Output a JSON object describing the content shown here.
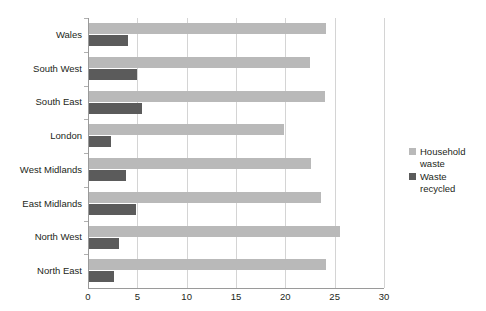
{
  "chart_data": {
    "type": "bar",
    "orientation": "horizontal",
    "title": "",
    "subtitle": "",
    "xlabel": "",
    "ylabel": "",
    "categories": [
      "Wales",
      "South West",
      "South East",
      "London",
      "West Midlands",
      "East Midlands",
      "North West",
      "North East"
    ],
    "series": [
      {
        "name": "Household waste",
        "color": "#b9b9b9",
        "values": [
          24.0,
          22.4,
          23.9,
          19.8,
          22.5,
          23.5,
          25.4,
          24.0
        ]
      },
      {
        "name": "Waste recycled",
        "color": "#5b5b5b",
        "values": [
          4.0,
          4.9,
          5.4,
          2.2,
          3.7,
          4.8,
          3.0,
          2.5
        ]
      }
    ],
    "xlim": [
      0,
      30
    ],
    "xticks": [
      0,
      5,
      10,
      15,
      20,
      25,
      30
    ],
    "xtick_labels": [
      "0",
      "5",
      "10",
      "15",
      "20",
      "25",
      "30"
    ],
    "grid": true,
    "grid_axis": "x",
    "legend_position": "right",
    "legend": [
      {
        "label": "Household waste",
        "color": "#b9b9b9"
      },
      {
        "label": "Waste recycled",
        "color": "#5b5b5b"
      }
    ]
  },
  "colors": {
    "background": "#ffffff",
    "axis": "#9a9a9a",
    "gridline": "#d4d4d4",
    "text": "#231f20",
    "household": "#b9b9b9",
    "recycled": "#5b5b5b"
  }
}
